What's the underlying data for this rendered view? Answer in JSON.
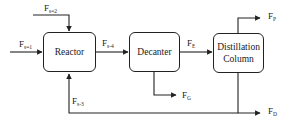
{
  "units": {
    "reactor": "Reactor",
    "decanter": "Decanter",
    "distillation": "Distillation Column"
  },
  "streams": {
    "s1": {
      "main": "F",
      "sub": "s=1"
    },
    "s2": {
      "main": "F",
      "sub": "s=2"
    },
    "s3": {
      "main": "F",
      "sub": "s-3"
    },
    "s4": {
      "main": "F",
      "sub": "s-4"
    },
    "e": {
      "main": "F",
      "sub": "E"
    },
    "g": {
      "main": "F",
      "sub": "G"
    },
    "p": {
      "main": "F",
      "sub": "P"
    },
    "d": {
      "main": "F",
      "sub": "D"
    }
  },
  "colors": {
    "line": "#222222",
    "background": "#ffffff"
  }
}
